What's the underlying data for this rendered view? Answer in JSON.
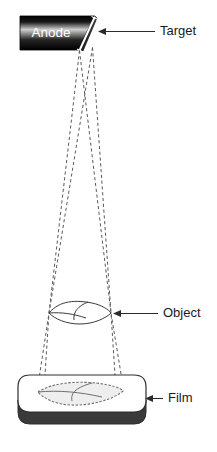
{
  "figure": {
    "kind": "radiography-geometric-unsharpness",
    "background_color": "#ffffff",
    "width": 217,
    "height": 452
  },
  "source": {
    "block_label": "Anode",
    "block_fill_dark": "#050505",
    "block_fill_light": "#d9d9d9",
    "target_face_color": "#ffffff",
    "target_face_label": "target-bevel"
  },
  "labels": {
    "target": "Target",
    "object": "Object",
    "film": "Film",
    "color": "#1a1a1a"
  },
  "beam": {
    "ray_color": "#5a5a5a",
    "ray_style": "dashed",
    "ray_count": 4,
    "focal_spot_points": [
      {
        "name": "focal-left",
        "x": 79.5,
        "y": 50.5
      },
      {
        "name": "focal-right",
        "x": 92.5,
        "y": 47.5
      }
    ],
    "object_edge_points": [
      {
        "name": "object-left-tip",
        "x": 49,
        "y": 313
      },
      {
        "name": "object-right-tip",
        "x": 111,
        "y": 313
      }
    ],
    "film_edge_points": [
      {
        "name": "penumbra-left-outer",
        "x": 37,
        "y": 392
      },
      {
        "name": "penumbra-left-inner",
        "x": 44,
        "y": 390
      },
      {
        "name": "penumbra-right-inner",
        "x": 116,
        "y": 390
      },
      {
        "name": "penumbra-right-outer",
        "x": 124,
        "y": 392
      }
    ]
  },
  "object_body": {
    "name": "lens-shaped-object",
    "center_x": 80,
    "center_y": 313,
    "half_width": 31,
    "half_height": 10,
    "stroke_color": "#3b3b3b"
  },
  "film_plate": {
    "name": "film-cassette",
    "top_face_color": "#ffffff",
    "edge_color": "#3a3a3a",
    "outline_color": "#2e2e2e",
    "left": 18,
    "right": 146,
    "top": 375,
    "bottom": 424,
    "thickness": 6
  },
  "projected_image": {
    "name": "penumbra-shadow",
    "fill_color": "#efeeee",
    "outline_color": "#6f6f6f",
    "outline_style": "fuzzy-dashed"
  },
  "leaders": [
    {
      "name": "target-leader",
      "text_key": "target",
      "text_x": 160,
      "text_y": 32,
      "line_from_x": 155,
      "line_to_x": 101,
      "line_y": 31.5
    },
    {
      "name": "object-leader",
      "text_key": "object",
      "text_x": 163,
      "text_y": 314,
      "line_from_x": 158,
      "line_to_x": 116,
      "line_y": 313.5
    },
    {
      "name": "film-leader",
      "text_key": "film",
      "text_x": 168,
      "text_y": 399,
      "line_from_x": 163,
      "line_to_x": 147,
      "line_y": 398.5
    }
  ]
}
